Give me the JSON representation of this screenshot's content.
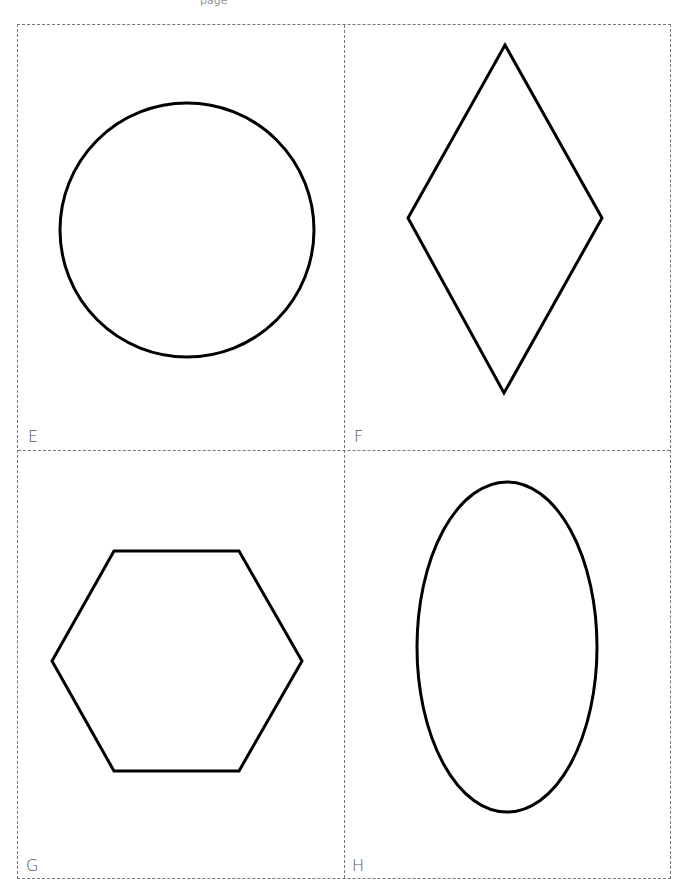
{
  "header": {
    "fragment_text": "page"
  },
  "cards": [
    {
      "label": "E",
      "shape": "circle",
      "shape_icon": "circle-icon"
    },
    {
      "label": "F",
      "shape": "diamond",
      "shape_icon": "diamond-icon"
    },
    {
      "label": "G",
      "shape": "hexagon",
      "shape_icon": "hexagon-icon"
    },
    {
      "label": "H",
      "shape": "ellipse",
      "shape_icon": "ellipse-icon"
    }
  ],
  "style": {
    "stroke_color": "#000000",
    "border_color": "#777777",
    "label_color": "#555555"
  }
}
